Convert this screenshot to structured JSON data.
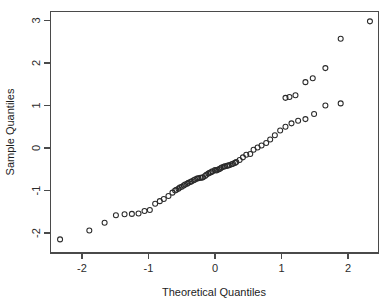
{
  "chart_data": {
    "type": "scatter",
    "title": "",
    "subtitle": "",
    "xlabel": "Theoretical Quantiles",
    "ylabel": "Sample Quantiles",
    "xlim": [
      -2.62,
      2.58
    ],
    "ylim": [
      -2.38,
      3.18
    ],
    "xticks": [
      -2,
      -1,
      0,
      1,
      2
    ],
    "xticklabels": [
      "-2",
      "-1",
      "0",
      "1",
      "2"
    ],
    "yticks": [
      -2,
      -1,
      0,
      1,
      2,
      3
    ],
    "yticklabels": [
      "-2",
      "-1",
      "0",
      "1",
      "2",
      "3"
    ],
    "grid": false,
    "legend": null,
    "marker": "open-circle",
    "marker_color": "#2a2a2a",
    "n_points": 72,
    "x": [
      -2.33,
      -1.89,
      -1.66,
      -1.49,
      -1.36,
      -1.25,
      -1.15,
      -1.06,
      -0.98,
      -0.9,
      -0.83,
      -0.77,
      -0.7,
      -0.64,
      -0.58,
      -0.53,
      -0.47,
      -0.42,
      -0.37,
      -0.32,
      -0.27,
      -0.22,
      -0.18,
      -0.13,
      -0.08,
      -0.04,
      0.0,
      0.04,
      0.08,
      0.13,
      0.18,
      0.22,
      0.27,
      0.32,
      0.37,
      0.42,
      0.47,
      0.53,
      0.58,
      0.64,
      0.7,
      0.77,
      0.83,
      0.9,
      0.98,
      1.06,
      1.15,
      1.25,
      1.36,
      1.49,
      1.66,
      1.89,
      2.33,
      -0.6,
      -0.55,
      -0.5,
      -0.45,
      -0.4,
      -0.35,
      -0.3,
      -0.25,
      -0.2,
      -0.15,
      -0.1,
      -0.06,
      0.02,
      0.06,
      0.1,
      0.15,
      0.2,
      0.25,
      0.3
    ],
    "y": [
      -2.15,
      -1.94,
      -1.76,
      -1.58,
      -1.56,
      -1.55,
      -1.54,
      -1.48,
      -1.46,
      -1.31,
      -1.25,
      -1.2,
      -1.13,
      -1.05,
      -0.98,
      -0.93,
      -0.88,
      -0.84,
      -0.8,
      -0.76,
      -0.72,
      -0.7,
      -0.69,
      -0.63,
      -0.58,
      -0.55,
      -0.52,
      -0.51,
      -0.48,
      -0.44,
      -0.42,
      -0.4,
      -0.37,
      -0.33,
      -0.28,
      -0.22,
      -0.16,
      -0.14,
      -0.04,
      0.01,
      0.06,
      0.12,
      0.2,
      0.3,
      0.41,
      0.5,
      0.58,
      0.64,
      0.68,
      0.8,
      1.0,
      1.05,
      2.98,
      -1.0,
      -0.96,
      -0.91,
      -0.86,
      -0.82,
      -0.78,
      -0.74,
      -0.71,
      -0.7,
      -0.66,
      -0.6,
      -0.57,
      -0.53,
      -0.5,
      -0.46,
      -0.43,
      -0.41,
      -0.38,
      -0.35
    ],
    "extra_upper_tail": {
      "x": [
        1.06,
        1.12,
        1.21,
        1.36,
        1.47,
        1.66,
        1.89
      ],
      "y": [
        1.18,
        1.2,
        1.24,
        1.55,
        1.64,
        1.88,
        2.57
      ]
    }
  },
  "axes": {
    "x_title": "Theoretical Quantiles",
    "y_title": "Sample Quantiles"
  }
}
